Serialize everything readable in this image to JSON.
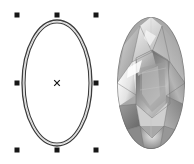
{
  "canvas": {
    "width": 194,
    "height": 164,
    "background_color": "#ffffff",
    "title": "Drawing canvas"
  },
  "objects": [
    {
      "id": "ellipse-object",
      "type": "ellipse",
      "name": "Ellipse",
      "selected": true,
      "fill": "none",
      "stroke_color": "#3c3c3c",
      "outline_style": "double-contour",
      "center": {
        "x": 57,
        "y": 83
      },
      "radius_x": 35,
      "radius_y": 63,
      "inner_radius_x": 32,
      "inner_radius_y": 60
    },
    {
      "id": "gem-object",
      "type": "raster-image",
      "name": "Faceted oval gemstone",
      "selected": false,
      "bounds": {
        "x": 117,
        "y": 17,
        "width": 68,
        "height": 132
      },
      "palette": [
        "#ffffff",
        "#e8e8e8",
        "#c8c8c8",
        "#a6a6a6",
        "#8a8a8a",
        "#6d6d6d",
        "#565656",
        "#3f3f3f"
      ]
    }
  ],
  "selection": {
    "object_id": "ellipse-object",
    "handle_color": "#161616",
    "handle_size": 5,
    "center_marker": "x-cross",
    "center_marker_color": "#141414",
    "bounding_box": {
      "left": 17,
      "top": 15,
      "right": 96,
      "bottom": 150
    },
    "handles": [
      {
        "name": "handle-top-left",
        "x": 17,
        "y": 15,
        "cursor": "nwse-resize"
      },
      {
        "name": "handle-top-center",
        "x": 57,
        "y": 15,
        "cursor": "ns-resize"
      },
      {
        "name": "handle-top-right",
        "x": 96,
        "y": 15,
        "cursor": "nesw-resize"
      },
      {
        "name": "handle-middle-left",
        "x": 17,
        "y": 83,
        "cursor": "ew-resize"
      },
      {
        "name": "handle-middle-right",
        "x": 96,
        "y": 83,
        "cursor": "ew-resize"
      },
      {
        "name": "handle-bottom-left",
        "x": 17,
        "y": 150,
        "cursor": "nesw-resize"
      },
      {
        "name": "handle-bottom-center",
        "x": 57,
        "y": 150,
        "cursor": "ns-resize"
      },
      {
        "name": "handle-bottom-right",
        "x": 96,
        "y": 150,
        "cursor": "nwse-resize"
      }
    ]
  }
}
